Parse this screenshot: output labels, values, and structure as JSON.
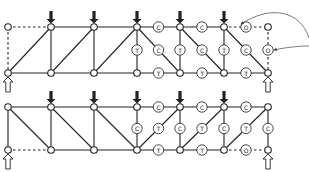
{
  "title": "",
  "legend": {
    "C": "compression member",
    "T": "tension member",
    "O": "zero-force member"
  },
  "trusses": [
    {
      "id": "truss-top",
      "top_y": 27,
      "bottom_y": 73,
      "node_x": [
        8,
        51,
        94,
        137,
        180,
        224,
        268
      ],
      "loads_at_top_nodes": [
        1,
        2,
        3,
        4,
        5
      ],
      "supports_at_bottom_nodes": [
        0,
        6
      ],
      "dashed_members": [
        [
          "t0",
          "t1"
        ],
        [
          "t0",
          "b0"
        ],
        [
          "t5",
          "t6"
        ],
        [
          "t6",
          "b6"
        ]
      ],
      "members": [
        {
          "from": "t1",
          "to": "t2"
        },
        {
          "from": "t2",
          "to": "t3"
        },
        {
          "from": "t3",
          "to": "t4",
          "label": "C"
        },
        {
          "from": "t4",
          "to": "t5",
          "label": "C"
        },
        {
          "from": "b0",
          "to": "b1"
        },
        {
          "from": "b1",
          "to": "b2"
        },
        {
          "from": "b2",
          "to": "b3"
        },
        {
          "from": "b3",
          "to": "b4",
          "label": "T"
        },
        {
          "from": "b4",
          "to": "b5",
          "label": "T"
        },
        {
          "from": "b5",
          "to": "b6",
          "label": "T"
        },
        {
          "from": "t1",
          "to": "b1"
        },
        {
          "from": "t2",
          "to": "b2"
        },
        {
          "from": "t3",
          "to": "b3",
          "label": "T"
        },
        {
          "from": "t4",
          "to": "b4",
          "label": "T"
        },
        {
          "from": "t5",
          "to": "b5",
          "label": "T"
        },
        {
          "from": "b0",
          "to": "t1"
        },
        {
          "from": "b1",
          "to": "t2"
        },
        {
          "from": "b2",
          "to": "t3"
        },
        {
          "from": "t3",
          "to": "b4",
          "label": "C"
        },
        {
          "from": "t4",
          "to": "b5",
          "label": "C"
        },
        {
          "from": "t5",
          "to": "b6",
          "label": "C"
        }
      ],
      "extra_labels": [
        {
          "text": "O",
          "on": [
            "t5",
            "t6"
          ]
        },
        {
          "text": "O",
          "on": [
            "t6",
            "b6"
          ]
        }
      ]
    },
    {
      "id": "truss-bottom",
      "top_y": 107,
      "bottom_y": 150,
      "node_x": [
        8,
        51,
        94,
        137,
        180,
        224,
        268
      ],
      "loads_at_top_nodes": [
        1,
        2,
        3,
        4,
        5
      ],
      "supports_at_bottom_nodes": [
        0,
        6
      ],
      "dashed_members": [
        [
          "b0",
          "b1"
        ],
        [
          "b5",
          "b6"
        ]
      ],
      "members": [
        {
          "from": "t0",
          "to": "t1"
        },
        {
          "from": "t1",
          "to": "t2"
        },
        {
          "from": "t2",
          "to": "t3"
        },
        {
          "from": "t3",
          "to": "t4",
          "label": "C"
        },
        {
          "from": "t4",
          "to": "t5",
          "label": "C"
        },
        {
          "from": "t5",
          "to": "t6",
          "label": "C"
        },
        {
          "from": "b1",
          "to": "b2"
        },
        {
          "from": "b2",
          "to": "b3"
        },
        {
          "from": "b3",
          "to": "b4",
          "label": "T"
        },
        {
          "from": "b4",
          "to": "b5",
          "label": "T"
        },
        {
          "from": "t0",
          "to": "b0"
        },
        {
          "from": "t1",
          "to": "b1"
        },
        {
          "from": "t2",
          "to": "b2"
        },
        {
          "from": "t3",
          "to": "b3",
          "label": "C"
        },
        {
          "from": "t4",
          "to": "b4",
          "label": "C"
        },
        {
          "from": "t5",
          "to": "b5",
          "label": "C"
        },
        {
          "from": "t6",
          "to": "b6",
          "label": "C"
        },
        {
          "from": "t0",
          "to": "b1"
        },
        {
          "from": "t1",
          "to": "b2"
        },
        {
          "from": "t2",
          "to": "b3"
        },
        {
          "from": "b3",
          "to": "t4",
          "label": "T"
        },
        {
          "from": "b4",
          "to": "t5",
          "label": "T"
        },
        {
          "from": "b5",
          "to": "t6",
          "label": "T"
        }
      ],
      "extra_labels": [
        {
          "text": "O",
          "on": [
            "b5",
            "b6"
          ]
        }
      ]
    }
  ],
  "annotations": [
    {
      "type": "curved-arrow",
      "description": "arrow pointing to zero-force top chord member",
      "from": [
        308,
        40
      ],
      "to": [
        240,
        25
      ]
    },
    {
      "type": "curved-arrow",
      "description": "arrow pointing to zero-force vertical member",
      "from": [
        308,
        58
      ],
      "to": [
        275,
        50
      ]
    }
  ]
}
